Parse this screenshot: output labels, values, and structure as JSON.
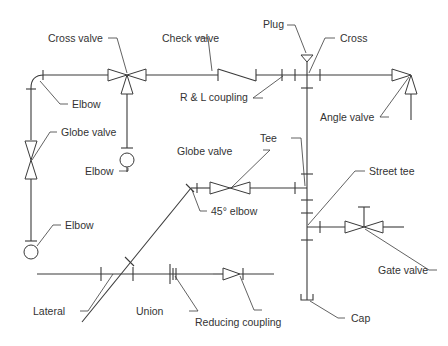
{
  "diagram": {
    "type": "piping-fittings-isometric",
    "labels": {
      "cross_valve": "Cross valve",
      "check_valve": "Check valve",
      "plug": "Plug",
      "cross": "Cross",
      "elbow_top": "Elbow",
      "rl_coupling": "R & L coupling",
      "angle_valve": "Angle valve",
      "globe_valve_left": "Globe valve",
      "elbow_mid": "Elbow",
      "tee": "Tee",
      "globe_valve_mid": "Globe valve",
      "street_tee": "Street tee",
      "elbow_45": "45° elbow",
      "elbow_left": "Elbow",
      "gate_valve": "Gate valve",
      "lateral": "Lateral",
      "union": "Union",
      "reducing_coupling": "Reducing coupling",
      "cap": "Cap"
    },
    "colors": {
      "line": "#3a3a3a",
      "text": "#333333",
      "background": "#ffffff"
    }
  }
}
